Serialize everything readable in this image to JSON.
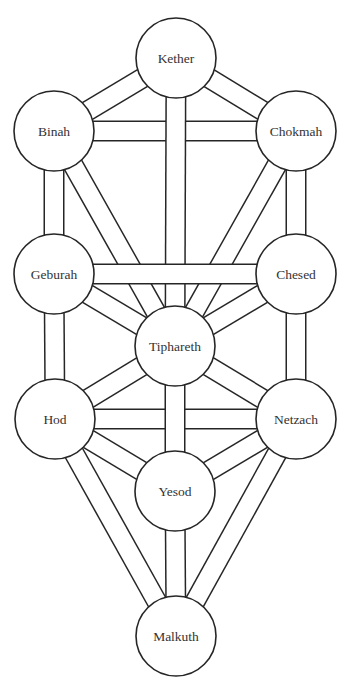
{
  "diagram": {
    "colors": {
      "background": "#ffffff",
      "stroke": "#262626",
      "label": "#333333"
    },
    "circle_radius": 40,
    "sephiroth": [
      {
        "id": "kether",
        "label": "Kether",
        "cx": 176,
        "cy": 58
      },
      {
        "id": "binah",
        "label": "Binah",
        "cx": 54,
        "cy": 131
      },
      {
        "id": "chokmah",
        "label": "Chokmah",
        "cx": 296,
        "cy": 131
      },
      {
        "id": "geburah",
        "label": "Geburah",
        "cx": 54,
        "cy": 274
      },
      {
        "id": "chesed",
        "label": "Chesed",
        "cx": 296,
        "cy": 274
      },
      {
        "id": "tiphareth",
        "label": "Tiphareth",
        "cx": 175,
        "cy": 346
      },
      {
        "id": "hod",
        "label": "Hod",
        "cx": 55,
        "cy": 419
      },
      {
        "id": "netzach",
        "label": "Netzach",
        "cx": 296,
        "cy": 419
      },
      {
        "id": "yesod",
        "label": "Yesod",
        "cx": 175,
        "cy": 491
      },
      {
        "id": "malkuth",
        "label": "Malkuth",
        "cx": 176,
        "cy": 636
      }
    ],
    "paths": [
      [
        "kether",
        "binah"
      ],
      [
        "kether",
        "chokmah"
      ],
      [
        "binah",
        "geburah"
      ],
      [
        "chokmah",
        "chesed"
      ],
      [
        "binah",
        "tiphareth"
      ],
      [
        "chokmah",
        "tiphareth"
      ],
      [
        "binah",
        "chokmah"
      ],
      [
        "geburah",
        "hod"
      ],
      [
        "chesed",
        "netzach"
      ],
      [
        "kether",
        "tiphareth"
      ],
      [
        "geburah",
        "tiphareth"
      ],
      [
        "chesed",
        "tiphareth"
      ],
      [
        "geburah",
        "chesed"
      ],
      [
        "hod",
        "tiphareth"
      ],
      [
        "netzach",
        "tiphareth"
      ],
      [
        "hod",
        "yesod"
      ],
      [
        "netzach",
        "yesod"
      ],
      [
        "hod",
        "malkuth"
      ],
      [
        "netzach",
        "malkuth"
      ],
      [
        "hod",
        "netzach"
      ],
      [
        "tiphareth",
        "yesod"
      ],
      [
        "yesod",
        "malkuth"
      ]
    ]
  }
}
